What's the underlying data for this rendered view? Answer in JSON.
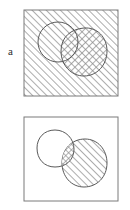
{
  "figure": {
    "type": "venn-overlap-diagram",
    "width": 130,
    "height": 210,
    "background_color": "#ffffff",
    "line_color": "#555555",
    "hatch_color": "#808080",
    "panels": [
      {
        "id": "a",
        "label": "a",
        "frame": {
          "x": 24,
          "y": 10,
          "width": 94,
          "height": 86
        },
        "frame_fill": "diagonal-hatch",
        "shapes": [
          {
            "name": "left-circle",
            "fill": "none",
            "outline": true,
            "cx": 58,
            "cy": 42,
            "rx": 20,
            "ry": 20
          },
          {
            "name": "right-blob",
            "fill": "cross-hatch",
            "outline": true,
            "cx": 84,
            "cy": 52,
            "rx": 23,
            "ry": 24
          }
        ],
        "overlap_fill": "cross-hatch"
      },
      {
        "id": "b",
        "label": "b",
        "frame": {
          "x": 24,
          "y": 117,
          "width": 94,
          "height": 84
        },
        "frame_fill": "none",
        "shapes": [
          {
            "name": "left-blob",
            "fill": "none",
            "outline": true,
            "cx": 56,
            "cy": 148,
            "rx": 18,
            "ry": 18
          },
          {
            "name": "right-blob",
            "fill": "diagonal-hatch",
            "outline": true,
            "cx": 84,
            "cy": 163,
            "rx": 23,
            "ry": 24
          }
        ],
        "overlap_fill": "cross-hatch"
      }
    ]
  }
}
